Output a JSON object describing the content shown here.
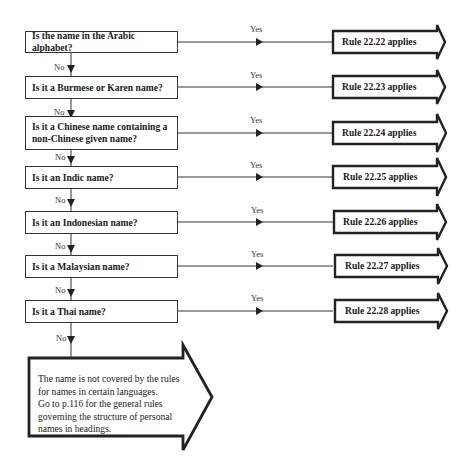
{
  "flowchart": {
    "questions": [
      {
        "text": "Is the name in the Arabic alphabet?",
        "yes_label": "Yes",
        "no_label": "No",
        "rule": "Rule 22.22 applies"
      },
      {
        "text": "Is it a Burmese or Karen name?",
        "yes_label": "Yes",
        "no_label": "No",
        "rule": "Rule 22.23 applies"
      },
      {
        "text": "Is it a Chinese name containing a non-Chinese given name?",
        "yes_label": "Yes",
        "no_label": "No",
        "rule": "Rule 22.24 applies"
      },
      {
        "text": "Is it an Indic name?",
        "yes_label": "Yes",
        "no_label": "No",
        "rule": "Rule 22.25 applies"
      },
      {
        "text": "Is it an Indonesian name?",
        "yes_label": "Yes",
        "no_label": "No",
        "rule": "Rule 22.26 applies"
      },
      {
        "text": "Is it a Malaysian name?",
        "yes_label": "Yes",
        "no_label": "No",
        "rule": "Rule 22.27 applies"
      },
      {
        "text": "Is it a Thai name?",
        "yes_label": "Yes",
        "no_label": "No",
        "rule": "Rule 22.28 applies"
      }
    ],
    "final": {
      "lines": [
        "The name is not covered by the rules",
        "for names in certain languages.",
        "Go to p.116 for the general rules",
        "governing the structure of personal",
        "names in headings."
      ]
    }
  },
  "colors": {
    "line": "#333333",
    "text": "#1a1a1a",
    "background": "#ffffff"
  }
}
